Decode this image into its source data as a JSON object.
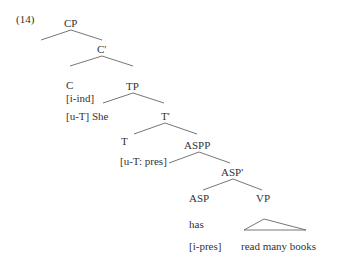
{
  "example_number": "(14)",
  "tree": {
    "cp": "CP",
    "c_bar": "C'",
    "c": "C",
    "c_feature_1": "[i-ind]",
    "c_feature_2": "[u-T]",
    "subject": "She",
    "tp": "TP",
    "t_bar": "T'",
    "t": "T",
    "t_feature": "[u-T: pres]",
    "aspp": "ASPP",
    "asp_bar": "ASP'",
    "asp": "ASP",
    "vp": "VP",
    "asp_word": "has",
    "asp_feature": "[i-pres]",
    "vp_words": "read many books"
  }
}
